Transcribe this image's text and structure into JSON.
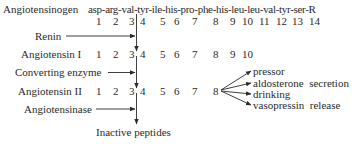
{
  "rows": {
    "angiotensinogen": {
      "label": "Angiotensinogen",
      "sequence": "asp-arg-val-tyr-ile-his-pro-phe-his-leu-leu-val-tyr-ser-R",
      "numbers": [
        "1",
        "2",
        "3",
        "4",
        "5",
        "6",
        "7",
        "8",
        "9",
        "10",
        "11",
        "12",
        "13",
        "14"
      ]
    },
    "renin": {
      "label": "Renin"
    },
    "angiotensin1": {
      "label": "Angiotensin I",
      "numbers": [
        "1",
        "2",
        "3",
        "4",
        "5",
        "6",
        "7",
        "8",
        "9",
        "10"
      ]
    },
    "converting": {
      "label": "Converting enzyme"
    },
    "angiotensin2": {
      "label": "Angiotensin II",
      "numbers": [
        "1",
        "2",
        "3",
        "4",
        "5",
        "6",
        "7",
        "8"
      ]
    },
    "angiotensinase": {
      "label": "Angiotensinase"
    },
    "product": {
      "label": "Inactive peptides"
    }
  },
  "effects": [
    "pressor",
    "aldosterone  secretion",
    "drinking",
    "vasopressin  release"
  ],
  "colors": {
    "ink": "#2a2a2a",
    "background": "#ffffff"
  }
}
